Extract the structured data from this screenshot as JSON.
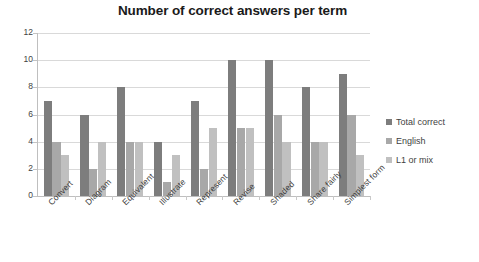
{
  "chart_data": {
    "type": "bar",
    "title": "Number of correct answers per term",
    "xlabel": "",
    "ylabel": "",
    "ylim": [
      0,
      12
    ],
    "yticks": [
      0,
      2,
      4,
      6,
      8,
      10,
      12
    ],
    "grid": true,
    "legend_position": "right",
    "categories": [
      "Convert",
      "Diagram",
      "Equivalent",
      "Illustrate",
      "Represent",
      "Revise",
      "Shaded",
      "Share fairly",
      "Simplest form"
    ],
    "series": [
      {
        "name": "Total correct",
        "color": "#7d7d7d",
        "values": [
          7,
          6,
          8,
          4,
          7,
          10,
          10,
          8,
          9
        ]
      },
      {
        "name": "English",
        "color": "#a8a8a8",
        "values": [
          4,
          2,
          4,
          1,
          2,
          5,
          6,
          4,
          6
        ]
      },
      {
        "name": "L1 or mix",
        "color": "#c0c0c0",
        "values": [
          3,
          4,
          4,
          3,
          5,
          5,
          4,
          4,
          3
        ]
      }
    ]
  }
}
